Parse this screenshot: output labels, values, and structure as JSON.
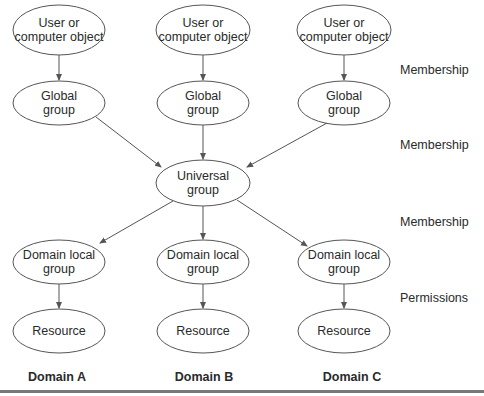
{
  "colors": {
    "stroke": "#555555",
    "text": "#2a2a2a",
    "rule": "#777777"
  },
  "columns": [
    {
      "domain": "Domain A",
      "user": [
        "User or",
        "computer object"
      ],
      "global": [
        "Global",
        "group"
      ],
      "domain_local": [
        "Domain local",
        "group"
      ],
      "resource": "Resource"
    },
    {
      "domain": "Domain B",
      "user": [
        "User or",
        "computer object"
      ],
      "global": [
        "Global",
        "group"
      ],
      "domain_local": [
        "Domain local",
        "group"
      ],
      "resource": "Resource"
    },
    {
      "domain": "Domain C",
      "user": [
        "User or",
        "computer object"
      ],
      "global": [
        "Global",
        "group"
      ],
      "domain_local": [
        "Domain local",
        "group"
      ],
      "resource": "Resource"
    }
  ],
  "universal": [
    "Universal",
    "group"
  ],
  "side_labels": [
    "Membership",
    "Membership",
    "Membership",
    "Permissions"
  ]
}
